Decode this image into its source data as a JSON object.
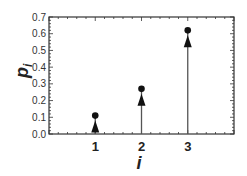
{
  "chart_data": {
    "type": "stem",
    "title": "",
    "xlabel": "i",
    "ylabel": "p_i",
    "ylabel_main": "p",
    "ylabel_sub": "i",
    "categories": [
      "1",
      "2",
      "3"
    ],
    "x": [
      1,
      2,
      3
    ],
    "values": [
      0.11,
      0.27,
      0.62
    ],
    "ylim": [
      0.0,
      0.7
    ],
    "xlim": [
      0,
      4
    ],
    "yticks": [
      "0.0",
      "0.1",
      "0.2",
      "0.3",
      "0.4",
      "0.5",
      "0.6",
      "0.7"
    ],
    "xticks": [
      "1",
      "2",
      "3"
    ],
    "grid": false,
    "legend": null,
    "marker": "circle with arrowhead",
    "colors": {
      "stem": "#555555",
      "marker": "#111111",
      "axis": "#333333"
    }
  }
}
